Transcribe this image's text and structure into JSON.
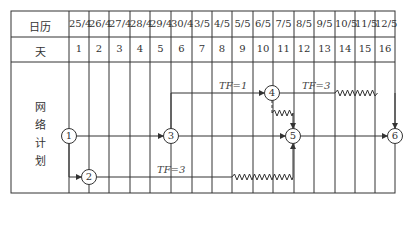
{
  "table": {
    "row_labels": {
      "calendar": "日历",
      "day": "天",
      "network": [
        "网",
        "络",
        "计",
        "划"
      ]
    },
    "dates": [
      "25/4",
      "26/4",
      "27/4",
      "28/4",
      "29/4",
      "30/4",
      "3/5",
      "4/5",
      "5/5",
      "6/5",
      "7/5",
      "8/5",
      "9/5",
      "10/5",
      "11/5",
      "12/5"
    ],
    "days": [
      "1",
      "2",
      "3",
      "4",
      "5",
      "6",
      "7",
      "8",
      "9",
      "10",
      "11",
      "12",
      "13",
      "14",
      "15",
      "16"
    ]
  },
  "network": {
    "nodes": [
      {
        "id": "1",
        "label": "1",
        "col": 0,
        "row": "mid"
      },
      {
        "id": "2",
        "label": "2",
        "col": 1,
        "row": "low"
      },
      {
        "id": "3",
        "label": "3",
        "col": 5,
        "row": "mid"
      },
      {
        "id": "4",
        "label": "4",
        "col": 10,
        "row": "top"
      },
      {
        "id": "5",
        "label": "5",
        "col": 11,
        "row": "mid"
      },
      {
        "id": "6",
        "label": "6",
        "col": 16,
        "row": "mid"
      }
    ],
    "float_labels": [
      {
        "text": "TF=1",
        "between": "3-4"
      },
      {
        "text": "TF=3",
        "between": "4-6"
      },
      {
        "text": "TF=3",
        "between": "2-5"
      }
    ]
  },
  "colors": {
    "line": "#333333",
    "background": "#ffffff"
  }
}
